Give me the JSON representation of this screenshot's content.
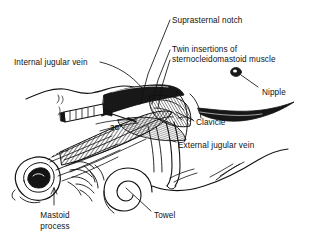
{
  "figure": {
    "type": "anatomical-illustration",
    "background_color": "#ffffff",
    "ink_color": "#111111",
    "view": "head turned to the patient's left, shoulder and chest visible at right"
  },
  "labels": [
    {
      "id": "suprasternal-notch",
      "text": "Suprasternal notch",
      "x": 172,
      "y": 16
    },
    {
      "id": "twin-insertions",
      "text": "Twin insertions of",
      "x": 172,
      "y": 45
    },
    {
      "id": "sternocleidomastoid",
      "text": "sternocleidomastoid muscle",
      "x": 172,
      "y": 55
    },
    {
      "id": "internal-jugular",
      "text": "Internal jugular vein",
      "x": 14,
      "y": 58
    },
    {
      "id": "nipple",
      "text": "Nipple",
      "x": 262,
      "y": 88
    },
    {
      "id": "clavicle",
      "text": "Clavicle",
      "x": 196,
      "y": 118
    },
    {
      "id": "external-jugular",
      "text": "External jugular vein",
      "x": 178,
      "y": 141
    },
    {
      "id": "mastoid-1",
      "text": "Mastoid",
      "x": 40,
      "y": 211
    },
    {
      "id": "mastoid-2",
      "text": "process",
      "x": 40,
      "y": 222
    },
    {
      "id": "towel",
      "text": "Towel",
      "x": 154,
      "y": 211
    }
  ],
  "annotations": {
    "needle_angle": "30",
    "needle_angle_symbol": "°"
  },
  "structures": [
    {
      "id": "ear",
      "name": "ear (auricle)"
    },
    {
      "id": "mastoid-process",
      "name": "mastoid process"
    },
    {
      "id": "sternocleidomastoid",
      "name": "sternocleidomastoid muscle, sternal and clavicular heads"
    },
    {
      "id": "clavicle",
      "name": "clavicle"
    },
    {
      "id": "suprasternal-notch",
      "name": "suprasternal notch"
    },
    {
      "id": "external-jugular-vein",
      "name": "external jugular vein"
    },
    {
      "id": "nipple",
      "name": "nipple"
    },
    {
      "id": "rolled-towel",
      "name": "rolled towel beneath shoulders"
    },
    {
      "id": "syringe",
      "name": "syringe and needle entering at 30 degrees"
    },
    {
      "id": "hair",
      "name": "hair tuft behind ear"
    }
  ]
}
